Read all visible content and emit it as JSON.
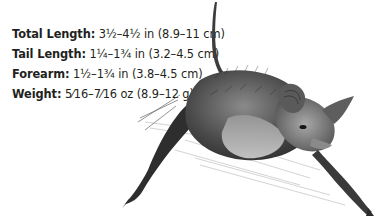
{
  "specs": [
    {
      "label": "Total Length:",
      "value": " 3½–4½ in (8.9–11 cm)"
    },
    {
      "label": "Tail Length:",
      "value": " 1¼–1¾ in (3.2–4.5 cm)"
    },
    {
      "label": "Forearm:",
      "value": " 1½–1¾ in (3.8–4.5 cm)"
    },
    {
      "label": "Weight:",
      "value": " 5⁄16–7⁄16 oz (8.9–12 g)"
    }
  ],
  "illustration": {
    "subject": "bat",
    "style": "grayscale pencil drawing",
    "colors": {
      "ink": "#231f20",
      "fur_dark": "#3a3a3a",
      "fur_mid": "#7a7a7a",
      "fur_light": "#b8b8b8",
      "background": "#ffffff"
    }
  }
}
